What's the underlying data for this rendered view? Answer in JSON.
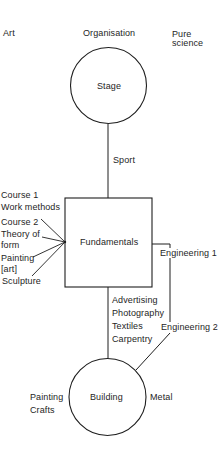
{
  "diagram": {
    "top_labels": {
      "left": "Art",
      "center": "Organisation",
      "right_line1": "Pure",
      "right_line2": "science"
    },
    "nodes": {
      "stage": "Stage",
      "fundamentals": "Fundamentals",
      "building": "Building"
    },
    "edge_labels": {
      "stage_fundamentals": "Sport",
      "fundamentals_building": [
        "Advertising",
        "Photography",
        "Textiles",
        "Carpentry"
      ],
      "engineering_1": "Engineering 1",
      "engineering_2": "Engineering 2"
    },
    "fundamentals_inputs": [
      {
        "line1": "Course 1",
        "line2": "Work methods"
      },
      {
        "line1": "Course 2",
        "line2": "Theory of",
        "line3": "form"
      },
      {
        "line1": "Painting",
        "line2": "[art]"
      },
      {
        "line1": "Sculpture"
      }
    ],
    "building_side_labels": {
      "left_line1": "Painting",
      "left_line2": "Crafts",
      "right": "Metal"
    },
    "colors": {
      "stroke": "#1e1e1e",
      "background": "#ffffff"
    }
  }
}
